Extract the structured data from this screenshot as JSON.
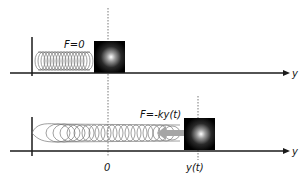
{
  "diagram": {
    "top_panel": {
      "force_label": "F=0",
      "axis_label": "y",
      "state": "equilibrium"
    },
    "bottom_panel": {
      "force_label": "F=-ky(t)",
      "axis_label": "y",
      "origin_label": "0",
      "position_label": "y(t)",
      "state": "displaced"
    },
    "colors": {
      "line": "#1a1a1a",
      "spring": "#6b6b6b",
      "arrow": "#9a9a9a",
      "block": "#000000",
      "highlight": "#ffffff"
    }
  }
}
